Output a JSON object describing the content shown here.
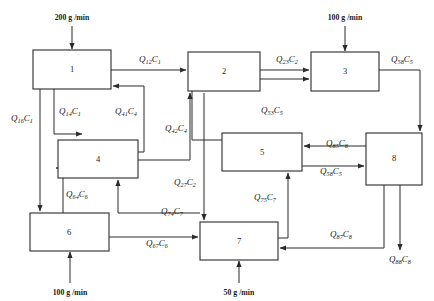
{
  "diagram": {
    "type": "process-flow-diagram",
    "units": [
      {
        "id": "1",
        "label": "1",
        "x": 33,
        "y": 50,
        "w": 78,
        "h": 39
      },
      {
        "id": "2",
        "label": "2",
        "x": 188,
        "y": 52,
        "w": 72,
        "h": 39
      },
      {
        "id": "3",
        "label": "3",
        "x": 311,
        "y": 52,
        "w": 68,
        "h": 39
      },
      {
        "id": "4",
        "label": "4",
        "x": 58,
        "y": 140,
        "w": 80,
        "h": 38
      },
      {
        "id": "5",
        "label": "5",
        "x": 222,
        "y": 133,
        "w": 80,
        "h": 38
      },
      {
        "id": "6",
        "label": "6",
        "x": 30,
        "y": 213,
        "w": 79,
        "h": 38
      },
      {
        "id": "7",
        "label": "7",
        "x": 200,
        "y": 222,
        "w": 78,
        "h": 38
      },
      {
        "id": "8",
        "label": "8",
        "x": 366,
        "y": 133,
        "w": 56,
        "h": 52
      }
    ],
    "feeds": [
      {
        "name": "feed-to-unit-1",
        "text": "200 g /min",
        "x": 72,
        "y": 17
      },
      {
        "name": "feed-to-unit-3",
        "text": "100 g /min",
        "x": 345,
        "y": 17
      },
      {
        "name": "feed-to-unit-6",
        "text": "100 g /min",
        "x": 70,
        "y": 292
      },
      {
        "name": "feed-to-unit-7",
        "text": "50 g /min",
        "x": 239,
        "y": 292
      }
    ],
    "streams": [
      {
        "name": "stream-q12",
        "q": "Q",
        "qsub": "12",
        "c": "C",
        "csub": "1",
        "x": 150,
        "y": 62,
        "from": "1",
        "to": "2"
      },
      {
        "name": "stream-q23",
        "q": "Q",
        "qsub": "23",
        "c": "C",
        "csub": "2",
        "x": 287,
        "y": 62,
        "from": "2",
        "to": "3"
      },
      {
        "name": "stream-q58",
        "q": "Q",
        "qsub": "58",
        "c": "C",
        "csub": "5",
        "x": 402,
        "y": 62,
        "from": "3",
        "to": "8"
      },
      {
        "name": "stream-q16",
        "q": "Q",
        "qsub": "16",
        "c": "C",
        "csub": "1",
        "x": 22,
        "y": 121,
        "from": "1",
        "to": "6"
      },
      {
        "name": "stream-q14",
        "q": "Q",
        "qsub": "14",
        "c": "C",
        "csub": "1",
        "x": 70,
        "y": 114,
        "from": "1",
        "to": "4"
      },
      {
        "name": "stream-q41",
        "q": "Q",
        "qsub": "41",
        "c": "C",
        "csub": "4",
        "x": 126,
        "y": 114,
        "from": "4",
        "to": "1"
      },
      {
        "name": "stream-q42",
        "q": "Q",
        "qsub": "42",
        "c": "C",
        "csub": "4",
        "x": 176,
        "y": 131,
        "from": "4",
        "to": "2"
      },
      {
        "name": "stream-q53",
        "q": "Q",
        "qsub": "53",
        "c": "C",
        "csub": "5",
        "x": 272,
        "y": 113,
        "from": "5",
        "to": "3"
      },
      {
        "name": "stream-q85",
        "q": "Q",
        "qsub": "85",
        "c": "C",
        "csub": "8",
        "x": 337,
        "y": 146,
        "from": "8",
        "to": "5"
      },
      {
        "name": "stream-q27",
        "q": "Q",
        "qsub": "27",
        "c": "C",
        "csub": "2",
        "x": 185,
        "y": 185,
        "from": "2",
        "to": "7"
      },
      {
        "name": "stream-q64",
        "q": "Q",
        "qsub": "64",
        "c": "C",
        "csub": "6",
        "x": 77,
        "y": 197,
        "from": "6",
        "to": "4"
      },
      {
        "name": "stream-q74",
        "q": "Q",
        "qsub": "74",
        "c": "C",
        "csub": "7",
        "x": 172,
        "y": 214,
        "from": "7",
        "to": "4"
      },
      {
        "name": "stream-q75",
        "q": "Q",
        "qsub": "75",
        "c": "C",
        "csub": "7",
        "x": 265,
        "y": 200,
        "from": "7",
        "to": "5"
      },
      {
        "name": "stream-q58b",
        "q": "Q",
        "qsub": "58",
        "c": "C",
        "csub": "5",
        "x": 331,
        "y": 174,
        "from": "5",
        "to": "8"
      },
      {
        "name": "stream-q67",
        "q": "Q",
        "qsub": "67",
        "c": "C",
        "csub": "6",
        "x": 157,
        "y": 246,
        "from": "6",
        "to": "7"
      },
      {
        "name": "stream-q87",
        "q": "Q",
        "qsub": "87",
        "c": "C",
        "csub": "8",
        "x": 341,
        "y": 237,
        "from": "8",
        "to": "7"
      },
      {
        "name": "stream-q88",
        "q": "Q",
        "qsub": "88",
        "c": "C",
        "csub": "8",
        "x": 400,
        "y": 262,
        "from": "8",
        "to": "outlet"
      }
    ]
  }
}
